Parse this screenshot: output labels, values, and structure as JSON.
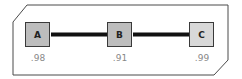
{
  "diagram": {
    "nodes": [
      {
        "id": "A",
        "label": "A",
        "value": ".98",
        "fill": "#bdbdbd"
      },
      {
        "id": "B",
        "label": "B",
        "value": ".91",
        "fill": "#bdbdbd"
      },
      {
        "id": "C",
        "label": "C",
        "value": ".99",
        "fill": "#d8d8d8"
      }
    ],
    "edges": [
      {
        "from": "A",
        "to": "B"
      },
      {
        "from": "B",
        "to": "C"
      }
    ],
    "colors": {
      "border": "#3a3a3a",
      "edge": "#111111",
      "value_text": "#888888"
    }
  }
}
